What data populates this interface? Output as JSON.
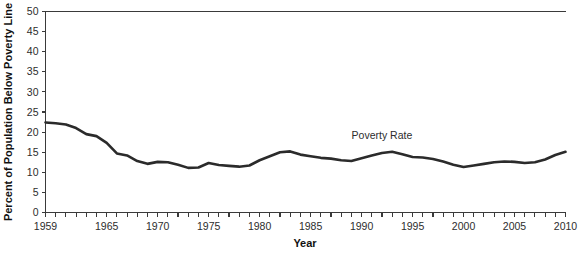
{
  "chart_data": {
    "type": "line",
    "title": "",
    "xlabel": "Year",
    "ylabel": "Percent of Population Below Poverty Line",
    "xlim": [
      1959,
      2010
    ],
    "ylim": [
      0,
      50
    ],
    "ytick_step": 5,
    "xtick_step": 1,
    "grid": false,
    "legend": false,
    "annotations": [
      {
        "text": "Poverty Rate",
        "x": 1992,
        "y": 18.2
      }
    ],
    "yticks": [
      0,
      5,
      10,
      15,
      20,
      25,
      30,
      35,
      40,
      45,
      50
    ],
    "ytick_labels": [
      "0",
      "5",
      "10",
      "15",
      "20",
      "25",
      "30",
      "35",
      "40",
      "45",
      "50"
    ],
    "xticks": [
      1959,
      1960,
      1961,
      1962,
      1963,
      1964,
      1965,
      1966,
      1967,
      1968,
      1969,
      1970,
      1971,
      1972,
      1973,
      1974,
      1975,
      1976,
      1977,
      1978,
      1979,
      1980,
      1981,
      1982,
      1983,
      1984,
      1985,
      1986,
      1987,
      1988,
      1989,
      1990,
      1991,
      1992,
      1993,
      1994,
      1995,
      1996,
      1997,
      1998,
      1999,
      2000,
      2001,
      2002,
      2003,
      2004,
      2005,
      2006,
      2007,
      2008,
      2009,
      2010
    ],
    "xtick_labels_shown": [
      "1959",
      "1965",
      "1970",
      "1975",
      "1980",
      "1985",
      "1990",
      "1995",
      "2000",
      "2005",
      "2010"
    ],
    "xtick_labels_shown_values": [
      1959,
      1965,
      1970,
      1975,
      1980,
      1985,
      1990,
      1995,
      2000,
      2005,
      2010
    ],
    "series": [
      {
        "name": "Poverty Rate",
        "color": "#2b2b2b",
        "x": [
          1959,
          1960,
          1961,
          1962,
          1963,
          1964,
          1965,
          1966,
          1967,
          1968,
          1969,
          1970,
          1971,
          1972,
          1973,
          1974,
          1975,
          1976,
          1977,
          1978,
          1979,
          1980,
          1981,
          1982,
          1983,
          1984,
          1985,
          1986,
          1987,
          1988,
          1989,
          1990,
          1991,
          1992,
          1993,
          1994,
          1995,
          1996,
          1997,
          1998,
          1999,
          2000,
          2001,
          2002,
          2003,
          2004,
          2005,
          2006,
          2007,
          2008,
          2009,
          2010
        ],
        "values": [
          22.4,
          22.2,
          21.9,
          21.0,
          19.5,
          19.0,
          17.3,
          14.7,
          14.2,
          12.8,
          12.1,
          12.6,
          12.5,
          11.9,
          11.1,
          11.2,
          12.3,
          11.8,
          11.6,
          11.4,
          11.7,
          13.0,
          14.0,
          15.0,
          15.2,
          14.4,
          14.0,
          13.6,
          13.4,
          13.0,
          12.8,
          13.5,
          14.2,
          14.8,
          15.1,
          14.5,
          13.8,
          13.7,
          13.3,
          12.7,
          11.9,
          11.3,
          11.7,
          12.1,
          12.5,
          12.7,
          12.6,
          12.3,
          12.5,
          13.2,
          14.3,
          15.1
        ]
      }
    ]
  }
}
